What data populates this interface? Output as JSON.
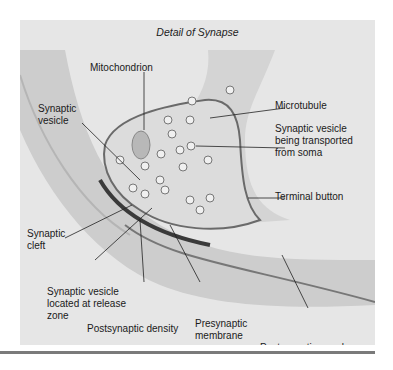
{
  "figure": {
    "title": "Detail of Synapse",
    "labels": {
      "mitochondrion": "Mitochondrion",
      "microtubule": "Microtubule",
      "synaptic_vesicle_1": "Synaptic",
      "synaptic_vesicle_2": "vesicle",
      "transported_1": "Synaptic vesicle",
      "transported_2": "being transported",
      "transported_3": "from soma",
      "terminal_button": "Terminal button",
      "synaptic_cleft_1": "Synaptic",
      "synaptic_cleft_2": "cleft",
      "release_zone_1": "Synaptic vesicle",
      "release_zone_2": "located at release",
      "release_zone_3": "zone",
      "postsynaptic_density": "Postsynaptic density",
      "presynaptic_1": "Presynaptic",
      "presynaptic_2": "membrane",
      "postsynaptic_membrane": "Postsynaptic membrane"
    },
    "colors": {
      "background": "#e6e6e6",
      "axon": "#cfcfcf",
      "terminal_interior": "#d9d9d9",
      "membrane": "#6a6a6a",
      "density": "#3a3a3a"
    }
  }
}
